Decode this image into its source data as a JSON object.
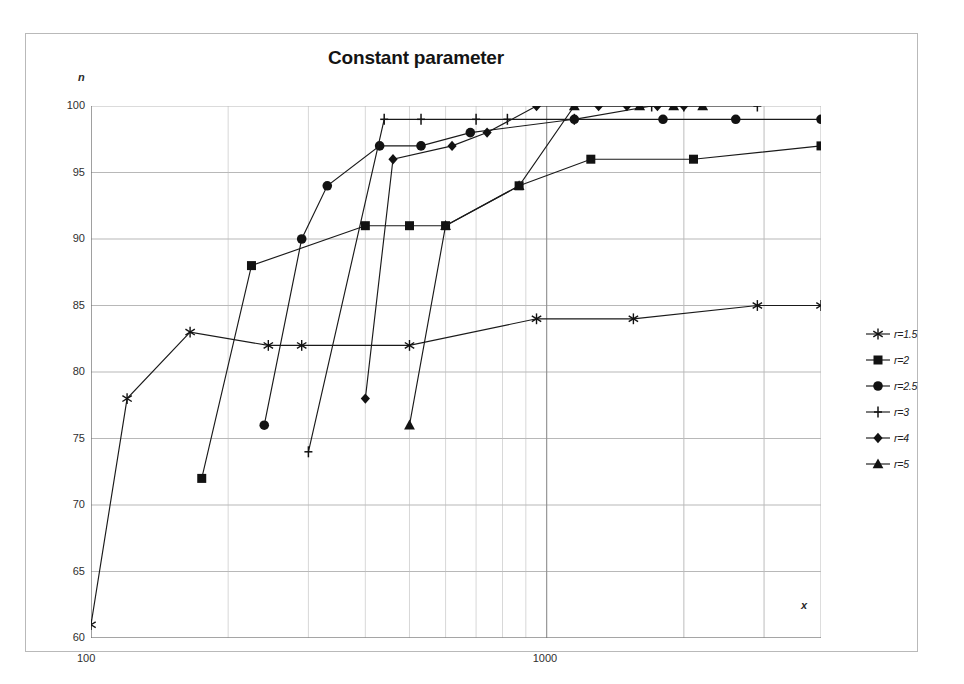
{
  "figure": {
    "title": "Constant parameter",
    "y_axis_label": "n",
    "x_axis_label": "x"
  },
  "legend": {
    "position": "right",
    "items": [
      {
        "label": "r=1.5",
        "marker": "star-marker"
      },
      {
        "label": "r=2",
        "marker": "square-marker"
      },
      {
        "label": "r=2.5",
        "marker": "circle-marker"
      },
      {
        "label": "r=3",
        "marker": "plus-marker"
      },
      {
        "label": "r=4",
        "marker": "diamond-marker"
      },
      {
        "label": "r=5",
        "marker": "triangle-marker"
      }
    ]
  },
  "axes": {
    "x_ticks": [
      "100",
      "1000"
    ],
    "y_ticks": [
      "100",
      "95",
      "90",
      "85",
      "80",
      "75",
      "70",
      "65",
      "60"
    ]
  },
  "chart_data": {
    "type": "line",
    "title": "Constant parameter",
    "xlabel": "x",
    "ylabel": "n",
    "xscale": "log",
    "xlim": [
      100,
      4000
    ],
    "ylim": [
      60,
      100
    ],
    "yticks": [
      60,
      65,
      70,
      75,
      80,
      85,
      90,
      95,
      100
    ],
    "xticks": [
      100,
      1000
    ],
    "grid": true,
    "legend_position": "right",
    "series": [
      {
        "name": "r=1.5",
        "marker": "star-marker",
        "points": [
          {
            "x": 100,
            "y": 61
          },
          {
            "x": 120,
            "y": 78
          },
          {
            "x": 165,
            "y": 83
          },
          {
            "x": 245,
            "y": 82
          },
          {
            "x": 290,
            "y": 82
          },
          {
            "x": 500,
            "y": 82
          },
          {
            "x": 950,
            "y": 84
          },
          {
            "x": 1550,
            "y": 84
          },
          {
            "x": 2900,
            "y": 85
          },
          {
            "x": 4000,
            "y": 85
          }
        ]
      },
      {
        "name": "r=2",
        "marker": "square-marker",
        "points": [
          {
            "x": 175,
            "y": 72
          },
          {
            "x": 225,
            "y": 88
          },
          {
            "x": 400,
            "y": 91
          },
          {
            "x": 500,
            "y": 91
          },
          {
            "x": 600,
            "y": 91
          },
          {
            "x": 870,
            "y": 94
          },
          {
            "x": 1250,
            "y": 96
          },
          {
            "x": 2100,
            "y": 96
          },
          {
            "x": 4000,
            "y": 97
          }
        ]
      },
      {
        "name": "r=2.5",
        "marker": "circle-marker",
        "points": [
          {
            "x": 240,
            "y": 76
          },
          {
            "x": 290,
            "y": 90
          },
          {
            "x": 330,
            "y": 94
          },
          {
            "x": 430,
            "y": 97
          },
          {
            "x": 530,
            "y": 97
          },
          {
            "x": 680,
            "y": 98
          },
          {
            "x": 1150,
            "y": 99
          },
          {
            "x": 1800,
            "y": 99
          },
          {
            "x": 2600,
            "y": 99
          },
          {
            "x": 4000,
            "y": 99
          }
        ]
      },
      {
        "name": "r=3",
        "marker": "plus-marker",
        "points": [
          {
            "x": 300,
            "y": 74
          },
          {
            "x": 440,
            "y": 99
          },
          {
            "x": 530,
            "y": 99
          },
          {
            "x": 700,
            "y": 99
          },
          {
            "x": 820,
            "y": 99
          },
          {
            "x": 1150,
            "y": 99
          },
          {
            "x": 1700,
            "y": 100
          },
          {
            "x": 2000,
            "y": 100
          },
          {
            "x": 2900,
            "y": 100
          }
        ]
      },
      {
        "name": "r=4",
        "marker": "diamond-marker",
        "points": [
          {
            "x": 400,
            "y": 78
          },
          {
            "x": 460,
            "y": 96
          },
          {
            "x": 620,
            "y": 97
          },
          {
            "x": 740,
            "y": 98
          },
          {
            "x": 950,
            "y": 100
          },
          {
            "x": 1300,
            "y": 100
          },
          {
            "x": 1500,
            "y": 100
          },
          {
            "x": 1750,
            "y": 100
          },
          {
            "x": 2000,
            "y": 100
          }
        ]
      },
      {
        "name": "r=5",
        "marker": "triangle-marker",
        "points": [
          {
            "x": 500,
            "y": 76
          },
          {
            "x": 600,
            "y": 91
          },
          {
            "x": 870,
            "y": 94
          },
          {
            "x": 1150,
            "y": 100
          },
          {
            "x": 1600,
            "y": 100
          },
          {
            "x": 1900,
            "y": 100
          },
          {
            "x": 2200,
            "y": 100
          }
        ]
      }
    ]
  }
}
